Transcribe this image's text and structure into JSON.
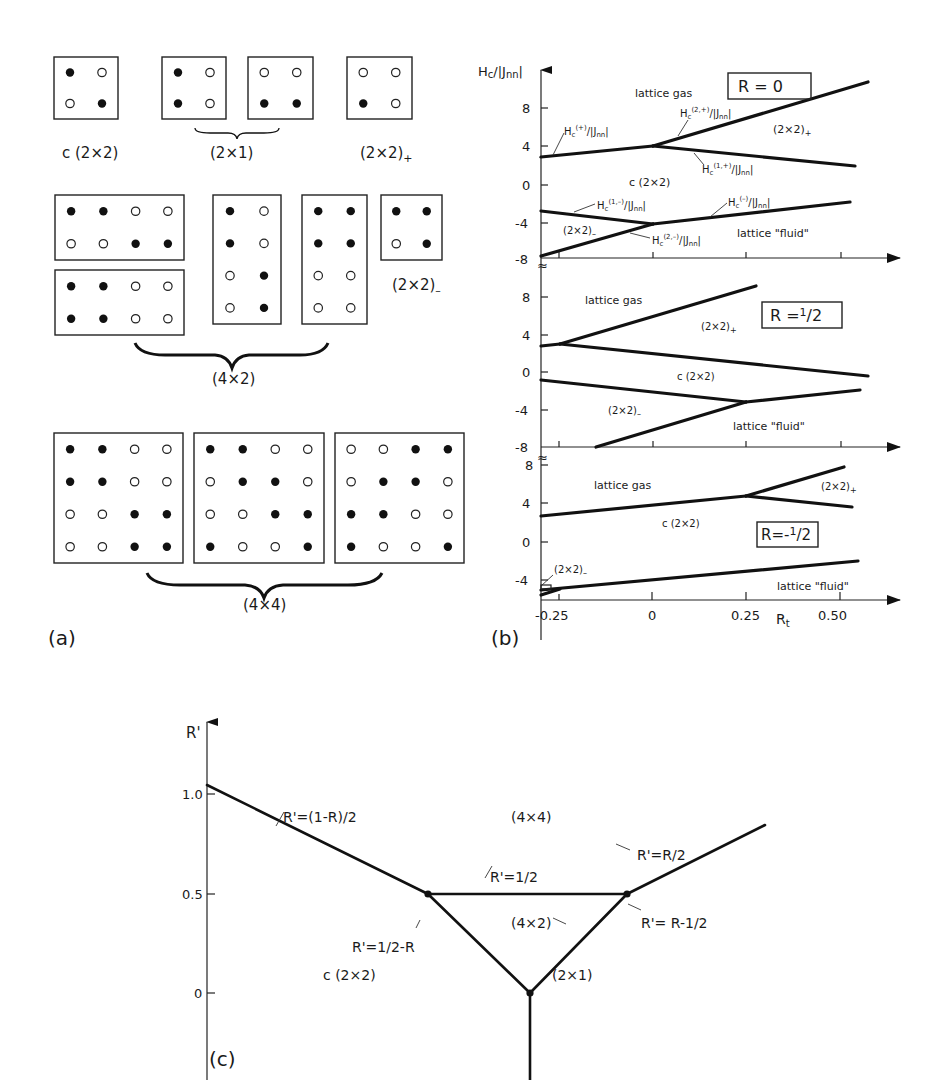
{
  "figure": {
    "panel_a": {
      "label": "(a)",
      "groups": [
        {
          "name": "c(2x2)",
          "label": "c (2×2)",
          "cells": [
            [
              [
                1,
                0
              ],
              [
                0,
                1
              ]
            ]
          ]
        },
        {
          "name": "2x1",
          "label": "(2×1)",
          "cells": [
            [
              [
                1,
                0
              ],
              [
                1,
                0
              ]
            ],
            [
              [
                0,
                0
              ],
              [
                1,
                1
              ]
            ]
          ]
        },
        {
          "name": "2x2-plus",
          "label": "(2×2)+",
          "cells": [
            [
              [
                0,
                0
              ],
              [
                1,
                0
              ]
            ]
          ]
        },
        {
          "name": "2x2-minus",
          "label": "(2×2)–",
          "cells": [
            [
              [
                1,
                1
              ],
              [
                0,
                1
              ]
            ]
          ]
        },
        {
          "name": "4x2",
          "label": "(4×2)",
          "cells": [
            [
              [
                1,
                1,
                0,
                0
              ],
              [
                0,
                0,
                1,
                1
              ]
            ],
            [
              [
                1,
                1,
                0,
                0
              ],
              [
                1,
                1,
                0,
                0
              ]
            ],
            [
              [
                1,
                0
              ],
              [
                1,
                0
              ],
              [
                0,
                1
              ],
              [
                0,
                1
              ]
            ],
            [
              [
                1,
                1
              ],
              [
                1,
                1
              ],
              [
                0,
                0
              ],
              [
                0,
                0
              ]
            ]
          ]
        },
        {
          "name": "4x4",
          "label": "(4×4)",
          "cells": [
            [
              [
                1,
                1,
                0,
                0
              ],
              [
                1,
                1,
                0,
                0
              ],
              [
                0,
                0,
                1,
                1
              ],
              [
                0,
                0,
                1,
                1
              ]
            ],
            [
              [
                1,
                1,
                0,
                0
              ],
              [
                0,
                1,
                1,
                0
              ],
              [
                0,
                0,
                1,
                1
              ],
              [
                1,
                0,
                0,
                1
              ]
            ],
            [
              [
                0,
                0,
                1,
                1
              ],
              [
                0,
                1,
                1,
                0
              ],
              [
                1,
                1,
                0,
                0
              ],
              [
                1,
                0,
                0,
                1
              ]
            ]
          ]
        }
      ]
    },
    "panel_b": {
      "label": "(b)",
      "ylabel": "Hc/|Jnn|",
      "xlabel": "Rt",
      "x_ticks": [
        "-0.25",
        "0",
        "0.25",
        "0.50"
      ],
      "y_ticks": [
        "8",
        "4",
        "0",
        "-4",
        "-8"
      ],
      "subpanels": [
        {
          "tag": "R = 0",
          "regions": [
            "lattice gas",
            "(2×2)+",
            "c (2×2)",
            "(2×2)–",
            "lattice \"fluid\""
          ],
          "curve_labels": [
            "Hc(+)/|Jnn|",
            "Hc(2,+)/|Jnn|",
            "Hc(1,+)/|Jnn|",
            "Hc(1,-)/|Jnn|",
            "Hc(-)/|Jnn|",
            "Hc(2,-)/|Jnn|"
          ]
        },
        {
          "tag": "R = 1/2",
          "regions": [
            "lattice gas",
            "(2×2)+",
            "c (2×2)",
            "(2×2)–",
            "lattice \"fluid\""
          ]
        },
        {
          "tag": "R = -1/2",
          "regions": [
            "lattice gas",
            "(2×2)+",
            "c (2×2)",
            "(2×2)–",
            "lattice \"fluid\""
          ]
        }
      ]
    },
    "panel_c": {
      "label": "(c)",
      "ylabel": "R'",
      "y_ticks": [
        "1.0",
        "0.5",
        "0"
      ],
      "regions": [
        "(4×4)",
        "(4×2)",
        "c (2×2)",
        "(2×1)"
      ],
      "line_labels": [
        "R'=(1-R)/2",
        "R'=1/2",
        "R'=R/2",
        "R'=1/2-R",
        "R'= R-1/2"
      ]
    }
  },
  "chart_data": [
    {
      "type": "line",
      "title": "Ground-state phase diagram, R = 0",
      "xlabel": "Rt",
      "ylabel": "Hc/|Jnn|",
      "xlim": [
        -0.3,
        0.6
      ],
      "ylim": [
        -8,
        12
      ],
      "series": [
        {
          "name": "Hc(+)/|Jnn|",
          "x": [
            -0.3,
            0.0
          ],
          "y": [
            2.8,
            3.9
          ]
        },
        {
          "name": "Hc(2,+)/|Jnn|",
          "x": [
            0.0,
            0.6
          ],
          "y": [
            3.9,
            10.5
          ]
        },
        {
          "name": "Hc(1,+)/|Jnn|",
          "x": [
            0.0,
            0.55
          ],
          "y": [
            3.9,
            1.8
          ]
        },
        {
          "name": "Hc(1,-)/|Jnn|",
          "x": [
            -0.3,
            0.0
          ],
          "y": [
            -2.8,
            -4.1
          ]
        },
        {
          "name": "Hc(2,-)/|Jnn|",
          "x": [
            -0.3,
            0.0
          ],
          "y": [
            -7.8,
            -4.1
          ]
        },
        {
          "name": "Hc(-)/|Jnn|",
          "x": [
            0.0,
            0.53
          ],
          "y": [
            -4.1,
            -2.0
          ]
        }
      ],
      "annotations": [
        "lattice gas",
        "(2×2)+",
        "c (2×2)",
        "(2×2)–",
        "lattice \"fluid\"",
        "R=0"
      ]
    },
    {
      "type": "line",
      "title": "Ground-state phase diagram, R = 1/2",
      "xlabel": "Rt",
      "ylabel": "Hc/|Jnn|",
      "xlim": [
        -0.3,
        0.6
      ],
      "ylim": [
        -8,
        10
      ],
      "series": [
        {
          "name": "upper-left",
          "x": [
            -0.3,
            -0.25
          ],
          "y": [
            2.8,
            3.0
          ]
        },
        {
          "name": "gas/(2x2)+",
          "x": [
            -0.25,
            0.28
          ],
          "y": [
            3.0,
            9.0
          ]
        },
        {
          "name": "(2x2)+/c(2x2)",
          "x": [
            -0.25,
            0.55
          ],
          "y": [
            3.0,
            -0.4
          ]
        },
        {
          "name": "c(2x2)/(2x2)-",
          "x": [
            -0.3,
            0.25
          ],
          "y": [
            -0.8,
            -3.2
          ]
        },
        {
          "name": "(2x2)-/fluid",
          "x": [
            -0.15,
            0.25
          ],
          "y": [
            -8.0,
            -3.2
          ]
        },
        {
          "name": "c(2x2)/fluid",
          "x": [
            0.25,
            0.53
          ],
          "y": [
            -3.2,
            -1.9
          ]
        }
      ],
      "annotations": [
        "lattice gas",
        "(2×2)+",
        "c (2×2)",
        "(2×2)–",
        "lattice \"fluid\"",
        "R=1/2"
      ]
    },
    {
      "type": "line",
      "title": "Ground-state phase diagram, R = -1/2",
      "xlabel": "Rt",
      "ylabel": "Hc/|Jnn|",
      "xlim": [
        -0.3,
        0.6
      ],
      "ylim": [
        -6,
        8
      ],
      "series": [
        {
          "name": "gas/c(2x2)",
          "x": [
            -0.3,
            0.25
          ],
          "y": [
            2.6,
            4.8
          ]
        },
        {
          "name": "gas/(2x2)+",
          "x": [
            0.25,
            0.52
          ],
          "y": [
            4.8,
            7.9
          ]
        },
        {
          "name": "(2x2)+/c(2x2)",
          "x": [
            0.25,
            0.54
          ],
          "y": [
            4.8,
            3.6
          ]
        },
        {
          "name": "c(2x2)/fluid",
          "x": [
            -0.3,
            0.55
          ],
          "y": [
            -5.2,
            -2.0
          ]
        }
      ],
      "annotations": [
        "lattice gas",
        "(2×2)+",
        "c (2×2)",
        "(2×2)–",
        "lattice \"fluid\"",
        "R=-1/2"
      ]
    },
    {
      "type": "line",
      "title": "Phase diagram in R–R' plane",
      "xlabel": "R",
      "ylabel": "R'",
      "ylim": [
        -0.5,
        1.2
      ],
      "series": [
        {
          "name": "R'=(1-R)/2",
          "x": [
            -1.1,
            0.0
          ],
          "y": [
            1.05,
            0.5
          ]
        },
        {
          "name": "R'=1/2",
          "x": [
            0.0,
            1.0
          ],
          "y": [
            0.5,
            0.5
          ]
        },
        {
          "name": "R'=R/2",
          "x": [
            1.0,
            1.7
          ],
          "y": [
            0.5,
            0.85
          ]
        },
        {
          "name": "R'=1/2-R",
          "x": [
            0.0,
            0.5
          ],
          "y": [
            0.5,
            0.0
          ]
        },
        {
          "name": "R'=R-1/2",
          "x": [
            0.5,
            1.0
          ],
          "y": [
            0.0,
            0.5
          ]
        },
        {
          "name": "vertical",
          "x": [
            0.5,
            0.5
          ],
          "y": [
            0.0,
            -0.5
          ]
        }
      ],
      "annotations": [
        "(4×4)",
        "(4×2)",
        "c (2×2)",
        "(2×1)"
      ],
      "grid": false
    }
  ]
}
